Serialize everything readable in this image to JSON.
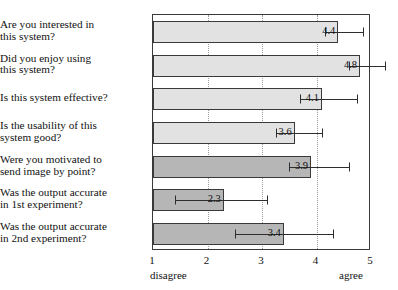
{
  "chart_data": {
    "type": "bar",
    "orientation": "horizontal",
    "title": "",
    "xlabel": "",
    "ylabel": "",
    "xlim": [
      1,
      5
    ],
    "xticks": [
      1,
      2,
      3,
      4,
      5
    ],
    "xtick_labels": [
      "1",
      "2",
      "3",
      "4",
      "5"
    ],
    "grid": "vertical dotted gridlines at 2, 3, 4",
    "legend": "none",
    "scale_anchor_low": "disagree",
    "scale_anchor_high": "agree",
    "categories": [
      "Are you interested in this system?",
      "Did you enjoy using this system?",
      "Is this system effective?",
      "Is the usability of this system good?",
      "Were you motivated to send image by point?",
      "Was the output accurate in 1st experiment?",
      "Was the output accurate in 2nd experiment?"
    ],
    "values": [
      4.4,
      4.8,
      4.1,
      3.6,
      3.9,
      2.3,
      3.4
    ],
    "value_labels": [
      "4.4",
      "4.8",
      "4.1",
      "3.6",
      "3.9",
      "2.3",
      "3.4"
    ],
    "error_low": [
      4.15,
      4.6,
      3.7,
      3.25,
      3.5,
      1.4,
      2.5
    ],
    "error_high": [
      4.85,
      5.25,
      4.75,
      4.1,
      4.6,
      3.1,
      4.3
    ],
    "bar_shades": [
      "light",
      "light",
      "light",
      "light",
      "dark",
      "dark",
      "dark"
    ],
    "colors": {
      "bar_light": "#e2e2e2",
      "bar_dark": "#b6b6b6",
      "bar_outline": "#3a3a3a",
      "error_bar": "#2e2e2e",
      "gridline": "#9a9a9a",
      "frame": "#3a3a3a",
      "text": "#111111",
      "background": "#ffffff"
    }
  },
  "labels": {
    "rows": [
      {
        "line1": "Are you interested in",
        "line2": "this system?"
      },
      {
        "line1": "Did you enjoy using",
        "line2": "this system?"
      },
      {
        "line1": "Is this system effective?",
        "line2": ""
      },
      {
        "line1": "Is the usability of this",
        "line2": "system good?"
      },
      {
        "line1": "Were you motivated to",
        "line2": "send image by point?"
      },
      {
        "line1": "Was the output accurate",
        "line2": "in 1st experiment?"
      },
      {
        "line1": "Was the output accurate",
        "line2": "in 2nd experiment?"
      }
    ]
  }
}
